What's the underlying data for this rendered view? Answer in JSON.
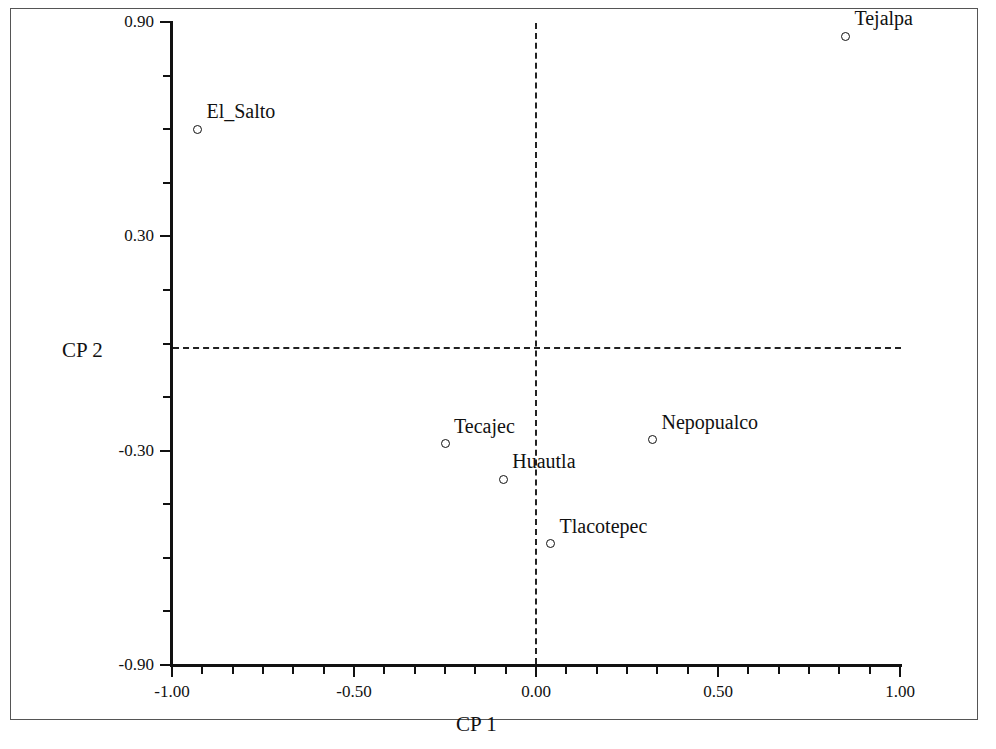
{
  "chart_data": {
    "type": "scatter",
    "title": "",
    "xlabel": "CP 1",
    "ylabel": "CP 2",
    "xlim": [
      -1.0,
      1.0
    ],
    "ylim": [
      -0.9,
      0.9
    ],
    "xticks": [
      "-1.00",
      "-0.50",
      "0.00",
      "0.50",
      "1.00"
    ],
    "xtick_values": [
      -1.0,
      -0.5,
      0.0,
      0.5,
      1.0
    ],
    "yticks": [
      "0.90",
      "0.30",
      "-0.30",
      "-0.90"
    ],
    "ytick_values": [
      0.9,
      0.3,
      -0.3,
      -0.9
    ],
    "grid": false,
    "legend": null,
    "reference_lines": [
      {
        "axis": "y",
        "value": 0.0,
        "style": "dashed"
      },
      {
        "axis": "x",
        "value": 0.0,
        "style": "dashed"
      }
    ],
    "marker": "open-circle",
    "points": [
      {
        "label": "El_Salto",
        "x": -0.93,
        "y": 0.6
      },
      {
        "label": "Tejalpa",
        "x": 0.85,
        "y": 0.86
      },
      {
        "label": "Tecajec",
        "x": -0.25,
        "y": -0.28
      },
      {
        "label": "Huautla",
        "x": -0.09,
        "y": -0.38
      },
      {
        "label": "Nepopualco",
        "x": 0.32,
        "y": -0.27
      },
      {
        "label": "Tlacotepec",
        "x": 0.04,
        "y": -0.56
      }
    ]
  },
  "axes": {
    "y_title": "CP 2",
    "x_title": "CP 1",
    "y_tick_labels": [
      "0.90",
      "0.30",
      "-0.30",
      "-0.90"
    ],
    "x_tick_labels": [
      "-1.00",
      "-0.50",
      "0.00",
      "0.50",
      "1.00"
    ]
  },
  "labels": {
    "el_salto": "El_Salto",
    "tejalpa": "Tejalpa",
    "tecajec": "Tecajec",
    "huautla": "Huautla",
    "nepopualco": "Nepopualco",
    "tlacotepec": "Tlacotepec"
  },
  "colors": {
    "background": "#ffffff",
    "axis": "#111111",
    "marker": "#111111",
    "reference_line": "#222222",
    "frame": "#555555"
  }
}
